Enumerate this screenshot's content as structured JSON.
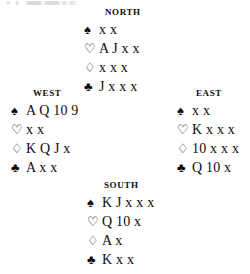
{
  "diagram": {
    "type": "bridge-deal",
    "suit_symbols": {
      "spade": "♠",
      "heart": "♡",
      "diamond": "♢",
      "club": "♣"
    },
    "hands": {
      "north": {
        "label": "NORTH",
        "spades": "x x",
        "hearts": "A J x x",
        "diamonds": "x x x",
        "clubs": "J x x x"
      },
      "west": {
        "label": "WEST",
        "spades": "A Q 10 9",
        "hearts": "x x",
        "diamonds": "K Q J x",
        "clubs": "A x x"
      },
      "east": {
        "label": "EAST",
        "spades": "x x",
        "hearts": "K x x x",
        "diamonds": "10 x x x",
        "clubs": "Q 10 x"
      },
      "south": {
        "label": "SOUTH",
        "spades": "K J x x x",
        "hearts": "Q 10 x",
        "diamonds": "A x",
        "clubs": "K x x"
      }
    }
  }
}
